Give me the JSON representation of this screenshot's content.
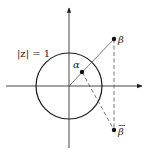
{
  "diagram": {
    "colors": {
      "stroke": "#1a1a1a",
      "axis": "#333333",
      "thin_line": "#555555",
      "text": "#222222",
      "background": "#ffffff"
    },
    "axes": {
      "origin": [
        69,
        86
      ],
      "x_axis": {
        "from": [
          6,
          86
        ],
        "to": [
          143,
          86
        ]
      },
      "y_axis": {
        "from": [
          69,
          148
        ],
        "to": [
          69,
          7
        ]
      }
    },
    "circle": {
      "center": [
        69,
        86
      ],
      "radius": 33,
      "label": "|z| = 1",
      "label_pos": [
        17,
        57
      ]
    },
    "points": {
      "alpha": {
        "pos": [
          82,
          72
        ],
        "label": "α",
        "label_pos": [
          73,
          68
        ]
      },
      "beta": {
        "pos": [
          114,
          39
        ],
        "label": "β",
        "label_pos": [
          118,
          43
        ]
      },
      "beta_bar": {
        "pos": [
          114,
          130
        ],
        "label": "β",
        "label_pos": [
          118,
          135
        ]
      }
    },
    "segments": {
      "origin_to_beta": {
        "from": [
          69,
          86
        ],
        "to": [
          114,
          39
        ],
        "style": "solid"
      },
      "alpha_to_beta_bar": {
        "from": [
          82,
          72
        ],
        "to": [
          114,
          130
        ],
        "style": "dashed"
      },
      "beta_to_beta_bar": {
        "from": [
          114,
          39
        ],
        "to": [
          114,
          130
        ],
        "style": "dashed"
      }
    }
  }
}
